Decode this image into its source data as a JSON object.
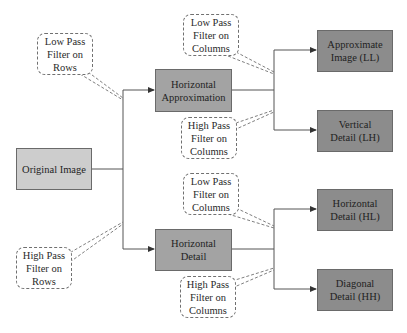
{
  "diagram": {
    "title": "",
    "nodes": {
      "original": {
        "label": "Original Image"
      },
      "h_approx": {
        "label": "Horizontal\nApproximation"
      },
      "h_detail": {
        "label": "Horizontal\nDetail"
      },
      "ll": {
        "label": "Approximate\nImage (LL)"
      },
      "lh": {
        "label": "Vertical\nDetail (LH)"
      },
      "hl": {
        "label": "Horizontal\nDetail (HL)"
      },
      "hh": {
        "label": "Diagonal\nDetail (HH)"
      }
    },
    "callouts": {
      "low_rows": {
        "label": "Low Pass\nFilter on\nRows"
      },
      "high_rows": {
        "label": "High Pass\nFilter on\nRows"
      },
      "low_cols_top": {
        "label": "Low Pass\nFilter on\nColumns"
      },
      "high_cols_top": {
        "label": "High Pass\nFilter on\nColumns"
      },
      "low_cols_bottom": {
        "label": "Low Pass\nFilter on\nColumns"
      },
      "high_cols_bottom": {
        "label": "High Pass\nFilter on\nColumns"
      }
    },
    "edges": [
      {
        "from": "Original Image",
        "to": "Horizontal Approximation",
        "via": "Low Pass Filter on Rows"
      },
      {
        "from": "Original Image",
        "to": "Horizontal Detail",
        "via": "High Pass Filter on Rows"
      },
      {
        "from": "Horizontal Approximation",
        "to": "Approximate Image (LL)",
        "via": "Low Pass Filter on Columns"
      },
      {
        "from": "Horizontal Approximation",
        "to": "Vertical Detail (LH)",
        "via": "High Pass Filter on Columns"
      },
      {
        "from": "Horizontal Detail",
        "to": "Horizontal Detail (HL)",
        "via": "Low Pass Filter on Columns"
      },
      {
        "from": "Horizontal Detail",
        "to": "Diagonal Detail (HH)",
        "via": "High Pass Filter on Columns"
      }
    ],
    "colors": {
      "original_fill": "#cdcdcd",
      "intermediate_fill": "#a3a3a3",
      "output_fill": "#8c8c8c",
      "line": "#555555",
      "callout_border": "#707070"
    }
  }
}
